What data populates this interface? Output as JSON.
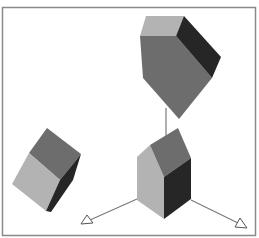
{
  "diagram": {
    "colors": {
      "background": "#ffffff",
      "frame": "#8a8a8a",
      "face_light": "#b3b3b3",
      "face_mid": "#6d6d6d",
      "face_dark": "#262626",
      "axis_line": "#7a7a7a",
      "arrow_fill": "#ffffff"
    },
    "objects": [
      {
        "name": "top-polyhedron",
        "faces": [
          "light",
          "mid",
          "dark"
        ]
      },
      {
        "name": "house-prism",
        "faces": [
          "light",
          "mid",
          "dark"
        ]
      },
      {
        "name": "tilted-cube",
        "faces": [
          "light",
          "mid",
          "dark"
        ]
      },
      {
        "name": "vertical-connector"
      },
      {
        "name": "axis-arrow-left"
      },
      {
        "name": "axis-arrow-right"
      }
    ]
  }
}
